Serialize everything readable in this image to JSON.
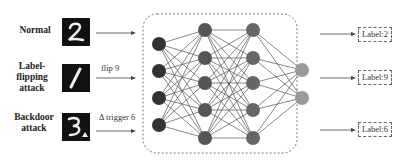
{
  "rows": [
    {
      "name": "normal",
      "label": "Normal",
      "digit": "2",
      "arrow_text": "",
      "output": "Label:2"
    },
    {
      "name": "label-flipping",
      "label": "Label-\nflipping\nattack",
      "digit": "1",
      "arrow_text": "flip 9",
      "output": "Label:9"
    },
    {
      "name": "backdoor",
      "label": "Backdoor\nattack",
      "digit": "3",
      "arrow_text": "Δ trigger 6",
      "output": "Label:6"
    }
  ],
  "network": {
    "layers": [
      4,
      5,
      5,
      2
    ],
    "colors": [
      "#333333",
      "#555555",
      "#666666",
      "#999999"
    ]
  }
}
